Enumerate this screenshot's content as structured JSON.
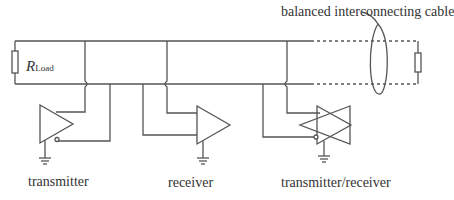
{
  "diagram": {
    "cable_label": "balanced interconnecting cable",
    "resistor": {
      "symbol": "R",
      "subscript": "Load"
    },
    "devices": [
      {
        "label": "transmitter",
        "type": "driver"
      },
      {
        "label": "receiver",
        "type": "receiver"
      },
      {
        "label": "transmitter/receiver",
        "type": "transceiver"
      }
    ],
    "colors": {
      "line": "#555555",
      "text": "#333333",
      "background": "#ffffff"
    }
  }
}
